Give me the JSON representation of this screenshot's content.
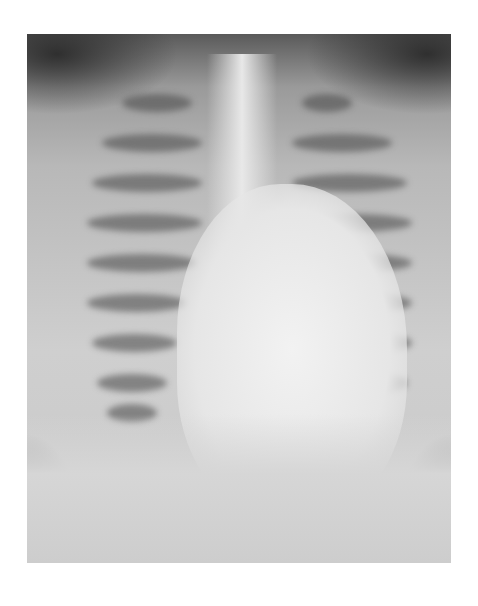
{
  "image": {
    "subject": "chest-xray",
    "view": "frontal",
    "colors": {
      "background": "#ffffff",
      "dark_corner": "#3a3a3a",
      "soft_tissue": "#bdbdbd",
      "mediastinum": "#ececec"
    }
  }
}
